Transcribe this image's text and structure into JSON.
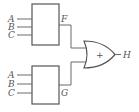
{
  "diagram": {
    "type": "logic-circuit",
    "blocks": [
      {
        "id": "top-block",
        "inputs": [
          "A",
          "B",
          "C"
        ],
        "output": "F"
      },
      {
        "id": "bottom-block",
        "inputs": [
          "A",
          "B",
          "C"
        ],
        "output": "G"
      }
    ],
    "gate": {
      "type": "OR",
      "symbol": "+",
      "inputs": [
        "F",
        "G"
      ],
      "output": "H"
    },
    "colors": {
      "line": "#555555",
      "background": "#ffffff"
    }
  }
}
